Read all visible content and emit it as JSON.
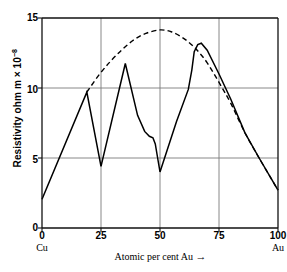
{
  "chart_data": {
    "type": "line",
    "title": "",
    "xlabel": "Atomic per cent Au",
    "xlabel_arrow": "→",
    "ylabel_text": "Resistivity ohm m × 10",
    "ylabel_exponent": "−8",
    "ylabel_full": "Resistivity ohm m × 10⁻⁸",
    "xlim": [
      0,
      100
    ],
    "ylim": [
      0,
      15
    ],
    "xticks": [
      0,
      25,
      50,
      75,
      100
    ],
    "xticklabels": [
      "0",
      "25",
      "50",
      "75",
      "100"
    ],
    "yticks": [
      0,
      5,
      10,
      15
    ],
    "yticklabels": [
      "0",
      "5",
      "10",
      "15"
    ],
    "grid": "xy-major",
    "axis_end_labels": [
      {
        "at": 0,
        "label": "Cu"
      },
      {
        "at": 100,
        "label": "Au"
      }
    ],
    "legend": "none",
    "series": [
      {
        "name": "ordered-alloy resistivity (solid)",
        "style": "solid",
        "color": "#000000",
        "points": [
          [
            0.0,
            2.05
          ],
          [
            19.0,
            9.7
          ],
          [
            25.0,
            4.4
          ],
          [
            35.3,
            11.75
          ],
          [
            40.5,
            8.05
          ],
          [
            43.5,
            6.9
          ],
          [
            45.5,
            6.55
          ],
          [
            47.0,
            6.45
          ],
          [
            48.0,
            6.0
          ],
          [
            49.0,
            5.0
          ],
          [
            50.0,
            4.0
          ],
          [
            57.0,
            7.6
          ],
          [
            62.0,
            9.9
          ],
          [
            63.5,
            11.3
          ],
          [
            64.5,
            12.6
          ],
          [
            66.0,
            13.1
          ],
          [
            67.5,
            13.2
          ],
          [
            70.0,
            12.7
          ],
          [
            75.0,
            11.0
          ],
          [
            80.0,
            9.2
          ],
          [
            86.0,
            6.8
          ],
          [
            92.0,
            5.0
          ],
          [
            100.0,
            2.7
          ]
        ]
      },
      {
        "name": "disordered solid-solution resistivity (dashed)",
        "style": "dashed",
        "color": "#000000",
        "points": [
          [
            19.0,
            9.7
          ],
          [
            24.0,
            10.9
          ],
          [
            29.0,
            11.9
          ],
          [
            34.0,
            12.75
          ],
          [
            39.0,
            13.45
          ],
          [
            44.0,
            13.9
          ],
          [
            50.0,
            14.15
          ],
          [
            55.0,
            14.0
          ],
          [
            60.0,
            13.55
          ],
          [
            64.0,
            13.0
          ],
          [
            66.5,
            12.55
          ],
          [
            70.0,
            11.8
          ],
          [
            75.0,
            10.4
          ],
          [
            80.0,
            8.9
          ],
          [
            86.0,
            6.8
          ],
          [
            92.0,
            5.0
          ],
          [
            100.0,
            2.7
          ]
        ]
      }
    ]
  },
  "axes": {
    "left_corner_label": "Cu",
    "right_corner_label": "Au"
  }
}
